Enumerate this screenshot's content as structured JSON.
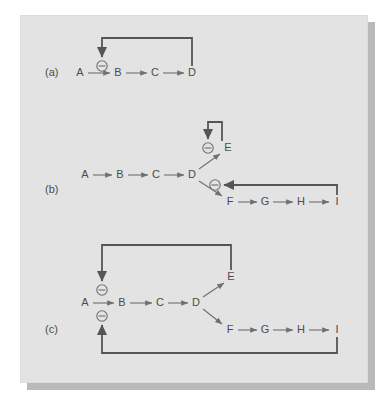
{
  "figure": {
    "background_color": "#ffffff",
    "panel_color": "#e3e3e3",
    "shadow_color": "#b9b9b9",
    "edge_color": "#707070",
    "feedback_color": "#555555",
    "text_color": "#4c4c4c",
    "panels": [
      {
        "id": "a",
        "label": "(a)",
        "label_x": 45,
        "label_y": 73,
        "nodes": [
          {
            "name": "A",
            "x": 80,
            "y": 73
          },
          {
            "name": "B",
            "x": 118,
            "y": 73
          },
          {
            "name": "C",
            "x": 155,
            "y": 73
          },
          {
            "name": "D",
            "x": 192,
            "y": 73
          }
        ],
        "inhibitors": [
          {
            "name": "minus-a1",
            "symbol": "minus-circle",
            "x": 102,
            "y": 66
          }
        ],
        "edges": [
          {
            "from": "A",
            "to": "B"
          },
          {
            "from": "B",
            "to": "C"
          },
          {
            "from": "C",
            "to": "D"
          }
        ],
        "feedback_edges": [
          {
            "from": "D",
            "to": "minus-a1",
            "kind": "end-product-inhibition"
          }
        ]
      },
      {
        "id": "b",
        "label": "(b)",
        "label_x": 45,
        "label_y": 190,
        "nodes": [
          {
            "name": "A",
            "x": 85,
            "y": 175
          },
          {
            "name": "B",
            "x": 120,
            "y": 175
          },
          {
            "name": "C",
            "x": 156,
            "y": 175
          },
          {
            "name": "D",
            "x": 192,
            "y": 175
          },
          {
            "name": "E",
            "x": 228,
            "y": 148
          },
          {
            "name": "F",
            "x": 230,
            "y": 202
          },
          {
            "name": "G",
            "x": 265,
            "y": 202
          },
          {
            "name": "H",
            "x": 301,
            "y": 202
          },
          {
            "name": "I",
            "x": 337,
            "y": 202
          }
        ],
        "inhibitors": [
          {
            "name": "minus-b1",
            "symbol": "minus-circle",
            "x": 208,
            "y": 148
          },
          {
            "name": "minus-b2",
            "symbol": "minus-circle",
            "x": 215,
            "y": 185
          }
        ],
        "edges": [
          {
            "from": "A",
            "to": "B"
          },
          {
            "from": "B",
            "to": "C"
          },
          {
            "from": "C",
            "to": "D"
          },
          {
            "from": "D",
            "to": "E"
          },
          {
            "from": "D",
            "to": "F"
          },
          {
            "from": "F",
            "to": "G"
          },
          {
            "from": "G",
            "to": "H"
          },
          {
            "from": "H",
            "to": "I"
          }
        ],
        "feedback_edges": [
          {
            "from": "E",
            "to": "minus-b1",
            "kind": "branch-inhibition"
          },
          {
            "from": "I",
            "to": "minus-b2",
            "kind": "branch-inhibition"
          }
        ]
      },
      {
        "id": "c",
        "label": "(c)",
        "label_x": 45,
        "label_y": 330,
        "nodes": [
          {
            "name": "A",
            "x": 85,
            "y": 303
          },
          {
            "name": "B",
            "x": 122,
            "y": 303
          },
          {
            "name": "C",
            "x": 160,
            "y": 303
          },
          {
            "name": "D",
            "x": 196,
            "y": 303
          },
          {
            "name": "E",
            "x": 231,
            "y": 277
          },
          {
            "name": "F",
            "x": 230,
            "y": 330
          },
          {
            "name": "G",
            "x": 265,
            "y": 330
          },
          {
            "name": "H",
            "x": 301,
            "y": 330
          },
          {
            "name": "I",
            "x": 337,
            "y": 330
          }
        ],
        "inhibitors": [
          {
            "name": "minus-c1",
            "symbol": "minus-circle",
            "x": 102,
            "y": 290
          },
          {
            "name": "minus-c2",
            "symbol": "minus-circle",
            "x": 102,
            "y": 316
          }
        ],
        "edges": [
          {
            "from": "A",
            "to": "B"
          },
          {
            "from": "B",
            "to": "C"
          },
          {
            "from": "C",
            "to": "D"
          },
          {
            "from": "D",
            "to": "E"
          },
          {
            "from": "D",
            "to": "F"
          },
          {
            "from": "F",
            "to": "G"
          },
          {
            "from": "G",
            "to": "H"
          },
          {
            "from": "H",
            "to": "I"
          }
        ],
        "feedback_edges": [
          {
            "from": "E",
            "to": "minus-c1",
            "kind": "concerted-inhibition"
          },
          {
            "from": "I",
            "to": "minus-c2",
            "kind": "concerted-inhibition"
          }
        ]
      }
    ]
  }
}
